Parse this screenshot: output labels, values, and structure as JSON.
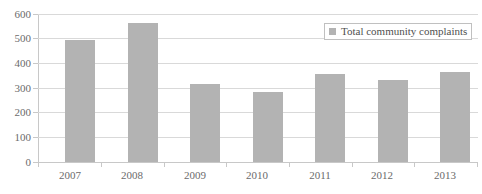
{
  "chart_data": {
    "type": "bar",
    "title": "",
    "subtitle": "",
    "xlabel": "",
    "ylabel": "",
    "categories": [
      "2007",
      "2008",
      "2009",
      "2010",
      "2011",
      "2012",
      "2013"
    ],
    "series": [
      {
        "name": "Total community complaints",
        "values": [
          493,
          565,
          318,
          285,
          357,
          333,
          363
        ],
        "color": "#b3b3b3"
      }
    ],
    "ylim": [
      0,
      600
    ],
    "y_ticks": [
      0,
      100,
      200,
      300,
      400,
      500,
      600
    ],
    "y_tick_labels": [
      "0",
      "100",
      "200",
      "300",
      "400",
      "500",
      "600"
    ],
    "grid": "horizontal",
    "legend": {
      "position": "top-right",
      "entries": [
        {
          "label": "Total community complaints",
          "marker": "square",
          "color": "#b3b3b3"
        }
      ]
    },
    "colors": {
      "background": "#ffffff",
      "bar": "#b3b3b3",
      "gridline": "#d9d9d9",
      "axis_line": "#c8c8c8",
      "tick_text": "#6b6b6b",
      "legend_border": "#c0c0c0",
      "legend_text": "#4f4f4f"
    }
  }
}
